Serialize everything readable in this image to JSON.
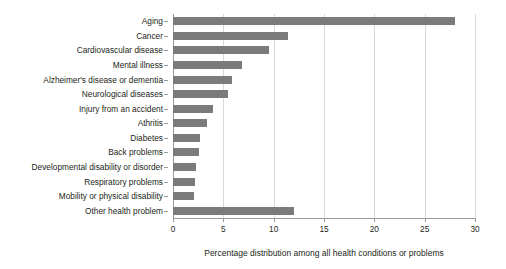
{
  "chart_data": {
    "type": "bar",
    "orientation": "horizontal",
    "title": "",
    "xlabel": "Percentage distribution among all health conditions or problems",
    "ylabel": "",
    "xlim": [
      0,
      30
    ],
    "xticks": [
      0,
      5,
      10,
      15,
      20,
      25,
      30
    ],
    "grid": true,
    "legend": null,
    "bar_color": "#7b7b7b",
    "categories": [
      "Aging",
      "Cancer",
      "Cardiovascular disease",
      "Mental illness",
      "Alzheimer's disease or dementia",
      "Neurological diseases",
      "Injury from an accident",
      "Athritis",
      "Diabetes",
      "Back problems",
      "Developmental disability or disorder",
      "Respiratory problems",
      "Mobility or physical disability",
      "Other health problem"
    ],
    "values": [
      28.0,
      11.4,
      9.5,
      6.9,
      5.9,
      5.5,
      4.0,
      3.4,
      2.7,
      2.6,
      2.3,
      2.2,
      2.1,
      12.0
    ]
  }
}
